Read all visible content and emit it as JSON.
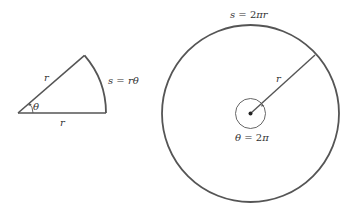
{
  "figure": {
    "sector": {
      "radius_label": "r",
      "base_label": "r",
      "angle_label": "θ",
      "arc_label": "s = rθ"
    },
    "circle": {
      "circumference_label": "s = 2πr",
      "radius_label": "r",
      "angle_label": "θ = 2π"
    },
    "colors": {
      "line": "#555555",
      "text": "#333333"
    }
  }
}
